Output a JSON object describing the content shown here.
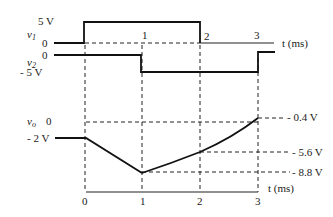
{
  "diagram": {
    "type": "waveform-timing-diagram",
    "signals": [
      {
        "name": "v1",
        "label": "v1",
        "levels": [
          "0",
          "5 V"
        ],
        "description": "0 V until t=0, 5 V from 0 to 2 ms, then 0 V"
      },
      {
        "name": "v2",
        "label": "v2",
        "levels": [
          "0",
          "- 5 V"
        ],
        "description": "0 V until t=1 ms, -5 V from 1 to 3 ms, then 0 V"
      },
      {
        "name": "vo",
        "label": "vo",
        "levels": [
          "0",
          "- 2 V"
        ],
        "description": "-2 V until t=0, ramps linearly to -8.8 V at 1 ms, rises to -5.6 V at 2 ms, rises to -0.4 V at 3 ms"
      }
    ],
    "labels": {
      "v1_5v": "5 V",
      "v1_name": "v",
      "v1_sub": "1",
      "v1_zero": "0",
      "v2_zero": "0",
      "v2_name": "v",
      "v2_sub": "2",
      "v2_neg5": "- 5 V",
      "vo_name": "v",
      "vo_sub": "o",
      "vo_zero": "0",
      "vo_neg2": "- 2 V",
      "t_axis_top": "t (ms)",
      "t_axis_bottom": "t (ms)",
      "tick_top_1": "1",
      "tick_top_2": "2",
      "tick_top_3": "3",
      "tick_bot_0": "0",
      "tick_bot_1": "1",
      "tick_bot_2": "2",
      "tick_bot_3": "3",
      "val_04": "- 0.4 V",
      "val_56": "- 5.6 V",
      "val_88": "- 8.8 V"
    },
    "vo_points": [
      {
        "t_ms": -1,
        "v": -2
      },
      {
        "t_ms": 0,
        "v": -2
      },
      {
        "t_ms": 1,
        "v": -8.8
      },
      {
        "t_ms": 2,
        "v": -5.6
      },
      {
        "t_ms": 3,
        "v": -0.4
      }
    ]
  }
}
